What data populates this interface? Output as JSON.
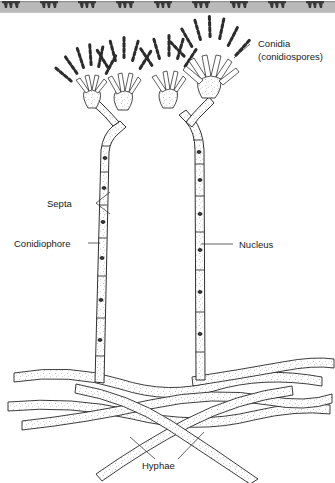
{
  "figure": {
    "style": "black-and-white scanned line art",
    "background_color": "#ffffff",
    "ink_color": "#1a1a1a"
  },
  "top_strip": {
    "name": "scan-artifact-strip",
    "description": "gray band of cropped repeating dark tripod-shaped marks from the page above",
    "band_color": "#b9b9b9",
    "mark_color": "#3a3a3a",
    "repeat_count": 9,
    "repeat_spacing_px": 38
  },
  "labels": [
    {
      "id": "conidia",
      "text_line1": "Conidia",
      "text_line2": "(conidiospores)",
      "x": 258,
      "y": 47,
      "anchor": "start"
    },
    {
      "id": "septa",
      "text_line1": "Septa",
      "text_line2": "",
      "x": 47,
      "y": 203,
      "anchor": "start"
    },
    {
      "id": "conidiophore",
      "text_line1": "Conidiophore",
      "text_line2": "",
      "x": 14,
      "y": 246,
      "anchor": "start"
    },
    {
      "id": "nucleus",
      "text_line1": "Nucleus",
      "text_line2": "",
      "x": 239,
      "y": 248,
      "anchor": "start"
    },
    {
      "id": "hyphae",
      "text_line1": "Hyphae",
      "text_line2": "",
      "x": 142,
      "y": 466,
      "anchor": "start"
    }
  ],
  "structures": {
    "conidial_heads": 4,
    "conidiophores": 2,
    "hyphae_strands": 6,
    "notes": "Each conidial head bears a swollen vesicle with radiating phialides and chains of beaded conidia; stalks are septate with stippled cytoplasm and dark oval nuclei."
  }
}
